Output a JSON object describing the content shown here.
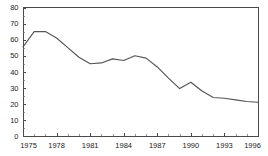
{
  "chart_data": {
    "type": "line",
    "title": "",
    "subtitle": "",
    "xlabel": "",
    "ylabel": "",
    "xlim": [
      1975,
      1996
    ],
    "ylim": [
      0,
      80
    ],
    "grid": false,
    "legend": null,
    "y_ticks": [
      0,
      10,
      20,
      30,
      40,
      50,
      60,
      70,
      80
    ],
    "y_tick_labels": [
      "0",
      "10",
      "20",
      "30",
      "40",
      "50",
      "60",
      "70",
      "80"
    ],
    "x_ticks": [
      1975,
      1978,
      1981,
      1984,
      1987,
      1990,
      1993,
      1996
    ],
    "x_tick_labels": [
      "1975",
      "1978",
      "1981",
      "1984",
      "1987",
      "1990",
      "1993",
      "1996"
    ],
    "x_minor_step": 1,
    "y_minor_step": 5,
    "line_color": "#555555",
    "axis_color": "#4a4a4a",
    "x": [
      1975,
      1976,
      1977,
      1978,
      1979,
      1980,
      1981,
      1982,
      1983,
      1984,
      1985,
      1986,
      1987,
      1988,
      1989,
      1990,
      1991,
      1992,
      1993,
      1994,
      1995,
      1996
    ],
    "values": [
      55.5,
      65,
      65,
      61,
      55,
      49,
      45,
      45.5,
      48,
      47,
      50,
      48.5,
      43,
      36,
      29.5,
      33.5,
      28,
      24,
      23.5,
      22.5,
      21.5,
      21
    ],
    "series": [
      {
        "name": "series-1",
        "values": [
          55.5,
          65,
          65,
          61,
          55,
          49,
          45,
          45.5,
          48,
          47,
          50,
          48.5,
          43,
          36,
          29.5,
          33.5,
          28,
          24,
          23.5,
          22.5,
          21.5,
          21
        ]
      }
    ]
  }
}
